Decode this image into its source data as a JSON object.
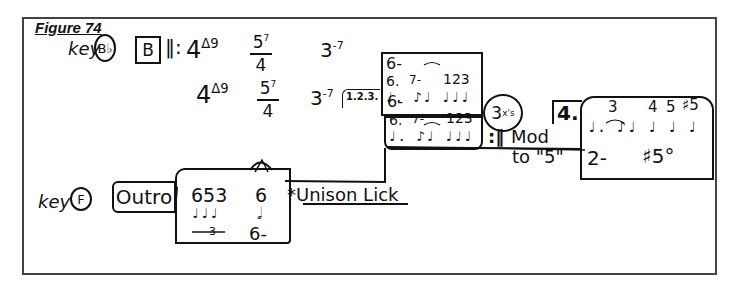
{
  "figure": {
    "title": "Figure 74"
  },
  "row1": {
    "key_label": "key",
    "key": "B♭",
    "section": "B",
    "repeat_start": "‖:",
    "chords": [
      {
        "root": "4",
        "quality": "Δ9"
      },
      {
        "root": "5",
        "quality": "7",
        "bass": "4"
      },
      {
        "root": "3",
        "quality": "-7"
      }
    ],
    "box1": {
      "chord": "6-",
      "degrees_a": "6.",
      "degrees_b": "7-",
      "degrees_c": "123",
      "rhythm": "♩. ♪♩ ♩♩♩"
    }
  },
  "row2": {
    "chords": [
      {
        "root": "4",
        "quality": "Δ9"
      },
      {
        "root": "5",
        "quality": "7",
        "bass": "4"
      },
      {
        "root": "3",
        "quality": "-7"
      }
    ],
    "ending_label": "1.2.3.",
    "box2": {
      "chord": "6-",
      "degrees_a": "6.",
      "degrees_b": "7-",
      "degrees_c": "123",
      "rhythm": "♩. ♪♩ ♩♩♩"
    },
    "repeat_end": ":‖",
    "repeat_count": "3",
    "repeat_count_sup": "x's",
    "mod_label": "Mod",
    "mod_target": "to \"5\"",
    "ending4": {
      "label": "4.",
      "degrees": [
        "3",
        "4",
        "5",
        "♯5"
      ],
      "rhythm": "♩. ♪♩ ♩ ♩ ♩",
      "chord1": "2-",
      "chord2": "♯5°"
    }
  },
  "row3": {
    "key_label": "key",
    "key": "F",
    "section": "Outro",
    "triplet_degrees": "653",
    "triplet_number": "3",
    "fermata_degree": "6",
    "final_chord": "6-",
    "annotation": "*Unison Lick"
  }
}
